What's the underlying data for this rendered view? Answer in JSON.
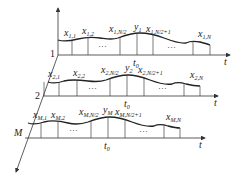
{
  "diagram": {
    "type": "multi-row time series sampling diagram",
    "axes": {
      "time_axis_label": "t",
      "vertical_axis": "amplitude",
      "depth_axis": "row index"
    },
    "rows": [
      {
        "index_label": "1",
        "samples": [
          "x1,1",
          "x1,2",
          "x1,N/2",
          "x1,N/2+1",
          "x1,N"
        ],
        "peak_label": "y1",
        "center_label": "t0",
        "ellipsis": "..."
      },
      {
        "index_label": "2",
        "samples": [
          "x2,1",
          "x2,2",
          "x2,N/2",
          "x2,N/2+1",
          "x2,N"
        ],
        "peak_label": "y2",
        "center_label": "t0",
        "ellipsis": "..."
      },
      {
        "index_label": "M",
        "samples": [
          "xM,1",
          "xM,2",
          "xM,N/2",
          "xM,N/2+1",
          "xM,N"
        ],
        "peak_label": "yM",
        "center_label": "t0",
        "ellipsis": "..."
      }
    ],
    "colors": {
      "stroke": "#333333",
      "background": "#ffffff"
    }
  },
  "labels": {
    "r1": {
      "idx": "1",
      "x": "x",
      "s1": "1,1",
      "s2": "1,2",
      "s3": "1,N/2",
      "y": "y",
      "ys": "1",
      "s4": "1,N/2+1",
      "s5": "1,N",
      "t": "t",
      "t0": "t",
      "t0s": "0",
      "dots": "···"
    },
    "r2": {
      "idx": "2",
      "x": "x",
      "s1": "2,1",
      "s2": "2,2",
      "s3": "2,N/2",
      "y": "y",
      "ys": "2",
      "s4": "2,N/2+1",
      "s5": "2,N",
      "t": "t",
      "t0": "t",
      "t0s": "0",
      "dots": "···"
    },
    "r3": {
      "idx": "M",
      "x": "x",
      "s1": "M,1",
      "s2": "M,2",
      "s3": "M,N/2",
      "y": "y",
      "ys": "M",
      "s4": "M,N/2+1",
      "s5": "M,N",
      "t": "t",
      "t0": "t",
      "t0s": "0",
      "dots": "···"
    }
  }
}
